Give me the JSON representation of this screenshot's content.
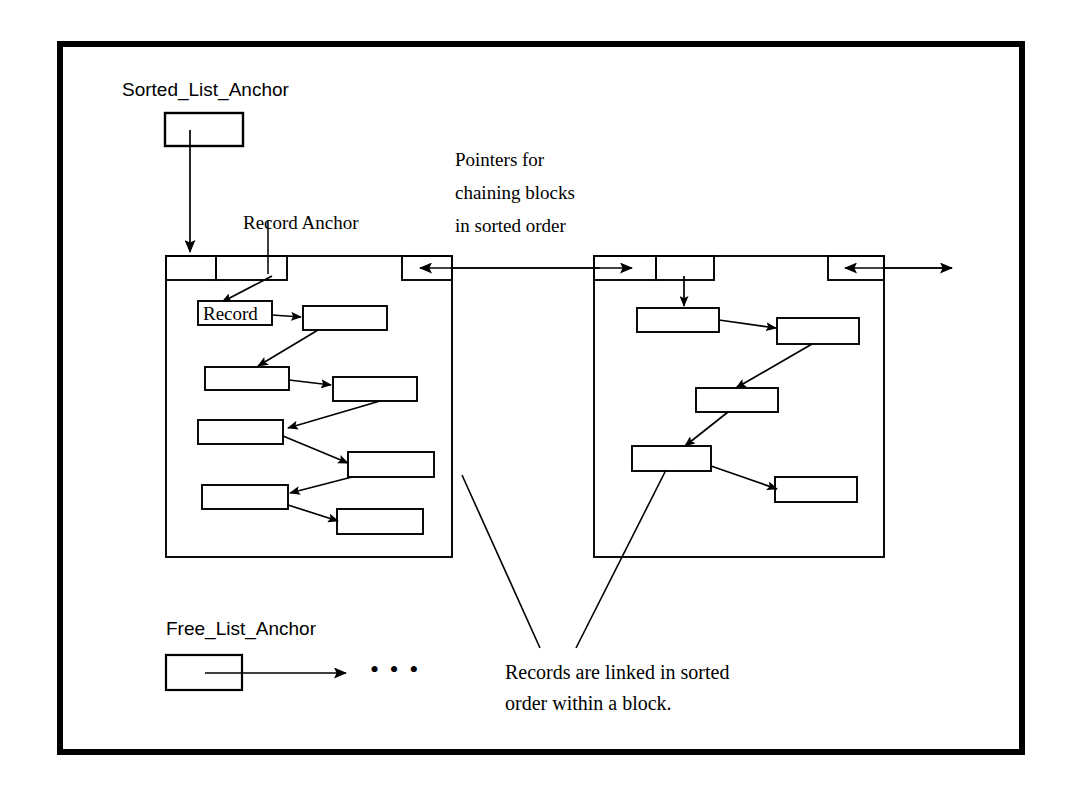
{
  "figure": {
    "background_color": "#ffffff",
    "ink_color": "#000000",
    "frame": {
      "x": 57,
      "y": 41,
      "width": 968,
      "height": 714,
      "stroke_width": 6
    }
  },
  "labels": {
    "sorted_list_anchor": "Sorted_List_Anchor",
    "record_anchor": "Record Anchor",
    "pointers_note_line1": "Pointers for",
    "pointers_note_line2": "chaining blocks",
    "pointers_note_line3": "in sorted order",
    "record_box_text": "Record",
    "free_list_anchor": "Free_List_Anchor",
    "free_list_ellipsis": "• • •",
    "caption_line1": "Records are linked in sorted",
    "caption_line2": "order within a block."
  },
  "anchors": [
    {
      "name": "sorted-list-anchor",
      "label": "Sorted_List_Anchor",
      "box": {
        "x": 165,
        "y": 113,
        "width": 78,
        "height": 33
      }
    },
    {
      "name": "free-list-anchor",
      "label": "Free_List_Anchor",
      "box": {
        "x": 166,
        "y": 655,
        "width": 76,
        "height": 35
      }
    }
  ],
  "blocks": [
    {
      "name": "block-1",
      "outline": {
        "x": 166,
        "y": 256,
        "width": 286,
        "height": 301
      },
      "header": {
        "left_cells": [
          {
            "x": 166,
            "y": 256,
            "width": 50,
            "height": 24
          },
          {
            "x": 216,
            "y": 256,
            "width": 71,
            "height": 24
          }
        ],
        "right_cell": {
          "x": 402,
          "y": 256,
          "width": 50,
          "height": 24
        }
      },
      "records": [
        {
          "index": 1,
          "x": 198,
          "y": 301,
          "width": 74,
          "height": 24,
          "text": "Record"
        },
        {
          "index": 2,
          "x": 303,
          "y": 306,
          "width": 84,
          "height": 24,
          "text": ""
        },
        {
          "index": 3,
          "x": 205,
          "y": 367,
          "width": 84,
          "height": 23,
          "text": ""
        },
        {
          "index": 4,
          "x": 333,
          "y": 377,
          "width": 84,
          "height": 24,
          "text": ""
        },
        {
          "index": 5,
          "x": 198,
          "y": 420,
          "width": 85,
          "height": 24,
          "text": ""
        },
        {
          "index": 6,
          "x": 348,
          "y": 452,
          "width": 86,
          "height": 25,
          "text": ""
        },
        {
          "index": 7,
          "x": 202,
          "y": 485,
          "width": 86,
          "height": 24,
          "text": ""
        },
        {
          "index": 8,
          "x": 337,
          "y": 509,
          "width": 86,
          "height": 25,
          "text": ""
        }
      ],
      "record_count": 8
    },
    {
      "name": "block-2",
      "outline": {
        "x": 594,
        "y": 256,
        "width": 290,
        "height": 301
      },
      "header": {
        "left_cells": [
          {
            "x": 594,
            "y": 256,
            "width": 62,
            "height": 24
          },
          {
            "x": 656,
            "y": 256,
            "width": 58,
            "height": 24
          }
        ],
        "right_cell": {
          "x": 828,
          "y": 256,
          "width": 56,
          "height": 24
        }
      },
      "records": [
        {
          "index": 1,
          "x": 637,
          "y": 308,
          "width": 82,
          "height": 24,
          "text": ""
        },
        {
          "index": 2,
          "x": 777,
          "y": 318,
          "width": 82,
          "height": 26,
          "text": ""
        },
        {
          "index": 3,
          "x": 696,
          "y": 388,
          "width": 82,
          "height": 24,
          "text": ""
        },
        {
          "index": 4,
          "x": 632,
          "y": 446,
          "width": 79,
          "height": 25,
          "text": ""
        },
        {
          "index": 5,
          "x": 775,
          "y": 477,
          "width": 82,
          "height": 25,
          "text": ""
        }
      ],
      "record_count": 5
    }
  ],
  "connections": {
    "sorted_anchor_to_block1": {
      "from": [
        190,
        146
      ],
      "to": [
        190,
        254
      ],
      "arrow": "down"
    },
    "record_anchor_leader": {
      "from": [
        268,
        222
      ],
      "to": [
        268,
        272
      ],
      "arrow": "none"
    },
    "record_anchor_to_record": {
      "from": [
        268,
        272
      ],
      "to": [
        226,
        300
      ],
      "arrow": "down-left"
    },
    "block1_right_to_block2_left": {
      "from": [
        452,
        268
      ],
      "to": [
        600,
        268
      ],
      "arrow": "both-inward"
    },
    "block2_right_outward": {
      "from": [
        884,
        268
      ],
      "to": [
        952,
        268
      ],
      "arrow": "right"
    },
    "block2_header_to_record1": {
      "from": [
        684,
        272
      ],
      "to": [
        684,
        306
      ],
      "arrow": "down"
    },
    "free_list_pointer": {
      "from": [
        205,
        673
      ],
      "to": [
        348,
        673
      ],
      "arrow": "right"
    },
    "caption_leader_block1": {
      "from": [
        540,
        645
      ],
      "to": [
        462,
        475
      ]
    },
    "caption_leader_block2": {
      "from": [
        575,
        645
      ],
      "to": [
        665,
        470
      ]
    }
  },
  "text_positions": {
    "sorted_list_anchor": {
      "x": 122,
      "y": 78,
      "size": 19
    },
    "record_anchor": {
      "x": 243,
      "y": 211,
      "size": 19
    },
    "pointers_note": {
      "x": 455,
      "y": 148,
      "size": 19
    },
    "free_list_anchor": {
      "x": 166,
      "y": 617,
      "size": 19
    },
    "free_list_ellipsis": {
      "x": 372,
      "y": 660,
      "size": 26
    },
    "caption": {
      "x": 505,
      "y": 660,
      "size": 20
    },
    "record_box_text": {
      "x": 203,
      "y": 303,
      "size": 19
    }
  }
}
